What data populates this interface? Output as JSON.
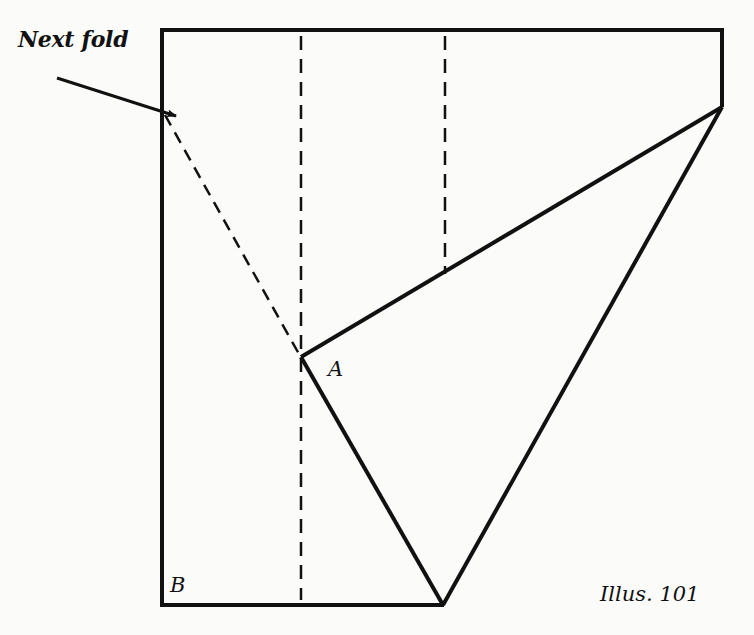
{
  "diagram": {
    "caption": "Illus. 101",
    "annotation": "Next fold",
    "points": {
      "A": "A",
      "B": "B"
    },
    "colors": {
      "line": "#111111",
      "background": "#fbfbfa"
    },
    "shapes": {
      "outline": [
        [
          162,
          30
        ],
        [
          722,
          30
        ],
        [
          722,
          107
        ],
        [
          443,
          605
        ],
        [
          162,
          605
        ]
      ],
      "fold_flap_lines": [
        {
          "from": [
            722,
            107
          ],
          "to": [
            301,
            357
          ]
        },
        {
          "from": [
            301,
            357
          ],
          "to": [
            443,
            605
          ]
        }
      ],
      "dashed_lines": [
        {
          "name": "left-vertical-crease",
          "from": [
            301,
            30
          ],
          "to": [
            301,
            605
          ]
        },
        {
          "name": "right-vertical-crease",
          "from": [
            445,
            30
          ],
          "to": [
            445,
            275
          ]
        },
        {
          "name": "next-fold-crease",
          "from": [
            165,
            115
          ],
          "to": [
            301,
            357
          ]
        }
      ],
      "arrow": {
        "from": [
          57,
          78
        ],
        "to": [
          176,
          116
        ]
      }
    }
  }
}
